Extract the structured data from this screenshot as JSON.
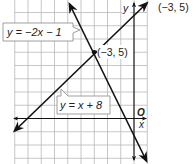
{
  "chart_data": {
    "type": "line",
    "title": "",
    "xlabel": "x",
    "ylabel": "y",
    "origin_label": "O",
    "xlim": [
      -9,
      1
    ],
    "ylim": [
      -3,
      9
    ],
    "grid": true,
    "series": [
      {
        "name": "y = x + 8",
        "equation": "y = x + 8",
        "slope": 1,
        "intercept": 8,
        "points": [
          [
            -9,
            -1
          ],
          [
            1,
            9
          ]
        ]
      },
      {
        "name": "y = −2x − 1",
        "equation": "y = -2x - 1",
        "slope": -2,
        "intercept": -1,
        "points": [
          [
            -5,
            9
          ],
          [
            1,
            -3
          ]
        ]
      }
    ],
    "annotations": [
      {
        "text": "(−3, 5)",
        "x": -3,
        "y": 5,
        "type": "intersection-point"
      }
    ]
  },
  "labels": {
    "line1": "y = −2x − 1",
    "line2": "y = x + 8",
    "intersection": "(−3, 5)",
    "answer": "(−3, 5)",
    "x_axis": "x",
    "y_axis": "y",
    "origin": "O"
  },
  "colors": {
    "grid": "#b8b8b8",
    "line": "#111111",
    "background": "#ffffff"
  }
}
